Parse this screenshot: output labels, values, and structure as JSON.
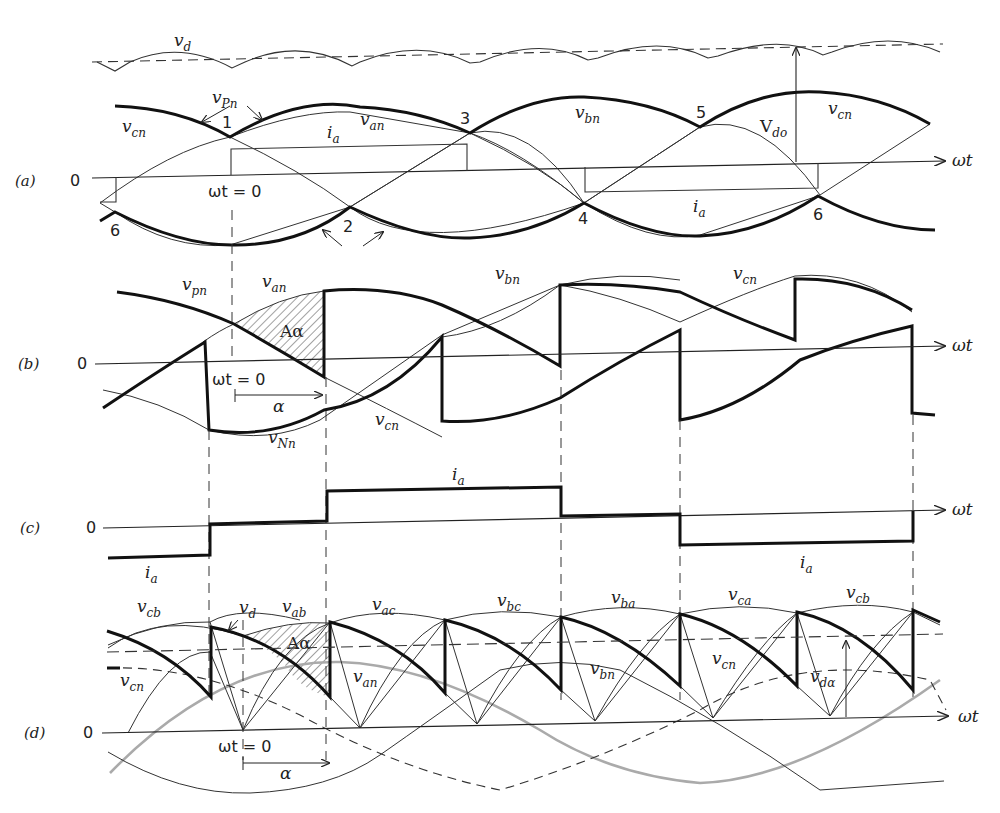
{
  "figure": {
    "panels": [
      {
        "id": "a",
        "label": "(a)",
        "zero": "0"
      },
      {
        "id": "b",
        "label": "(b)",
        "zero": "0"
      },
      {
        "id": "c",
        "label": "(c)",
        "zero": "0"
      },
      {
        "id": "d",
        "label": "(d)",
        "zero": "0"
      }
    ],
    "axis_label": "ωt",
    "wt0_label": "ωt = 0",
    "alpha_label": "α",
    "area_label": "Aα",
    "panel_a": {
      "vd": "v",
      "vd_sub": "d",
      "vPn": "v",
      "vPn_sub": "Pn",
      "vNn": "v",
      "vNn_sub": "Nn",
      "vcn": "v",
      "vcn_sub": "cn",
      "van": "v",
      "van_sub": "an",
      "vbn": "v",
      "vbn_sub": "bn",
      "vcn2": "v",
      "vcn2_sub": "cn",
      "ia": "i",
      "ia_sub": "a",
      "ia2": "i",
      "ia2_sub": "a",
      "Vdo": "V",
      "Vdo_sub": "do",
      "commutation_points": [
        "1",
        "2",
        "3",
        "4",
        "5",
        "6",
        "6"
      ]
    },
    "panel_b": {
      "vpn": "v",
      "vpn_sub": "pn",
      "van": "v",
      "van_sub": "an",
      "vbn": "v",
      "vbn_sub": "bn",
      "vcn_top": "v",
      "vcn_top_sub": "cn",
      "vcn": "v",
      "vcn_sub": "cn",
      "vNn": "v",
      "vNn_sub": "Nn"
    },
    "panel_c": {
      "ia_top": "i",
      "ia_top_sub": "a",
      "ia_left": "i",
      "ia_left_sub": "a",
      "ia_right": "i",
      "ia_right_sub": "a"
    },
    "panel_d": {
      "line_voltages": [
        {
          "v": "v",
          "sub": "cb"
        },
        {
          "v": "v",
          "sub": "ab"
        },
        {
          "v": "v",
          "sub": "ac"
        },
        {
          "v": "v",
          "sub": "bc"
        },
        {
          "v": "v",
          "sub": "ba"
        },
        {
          "v": "v",
          "sub": "ca"
        },
        {
          "v": "v",
          "sub": "cb"
        }
      ],
      "vd": "v",
      "vd_sub": "d",
      "vcn": "v",
      "vcn_sub": "cn",
      "van": "v",
      "van_sub": "an",
      "vbn": "v",
      "vbn_sub": "bn",
      "vcn2": "v",
      "vcn2_sub": "cn",
      "vdalpha": "v",
      "vdalpha_sub": "dα"
    }
  }
}
